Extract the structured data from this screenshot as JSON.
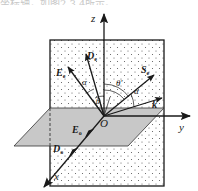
{
  "caption_fragment": "坐标轴，如图2.3.4所示。",
  "diagram": {
    "type": "crystal-optics-coordinate-diagram",
    "axes": {
      "x": "x",
      "y": "y",
      "z": "z",
      "origin": "O"
    },
    "vectors": {
      "E_e": {
        "main": "E",
        "sub": "e"
      },
      "D_e": {
        "main": "D",
        "sub": "e"
      },
      "S_e": {
        "main": "S",
        "sub": "e"
      },
      "k": {
        "main": "k"
      },
      "E_o": {
        "main": "E",
        "sub": "o"
      },
      "D_o": {
        "main": "D",
        "sub": "o"
      }
    },
    "angles": {
      "alpha_left": "α",
      "alpha_right": "α",
      "theta": "θ",
      "theta_prime": "θ′"
    },
    "colors": {
      "plane_fill": "#c8c8c8",
      "line": "#1a1a1a",
      "dots": "#555555"
    }
  }
}
